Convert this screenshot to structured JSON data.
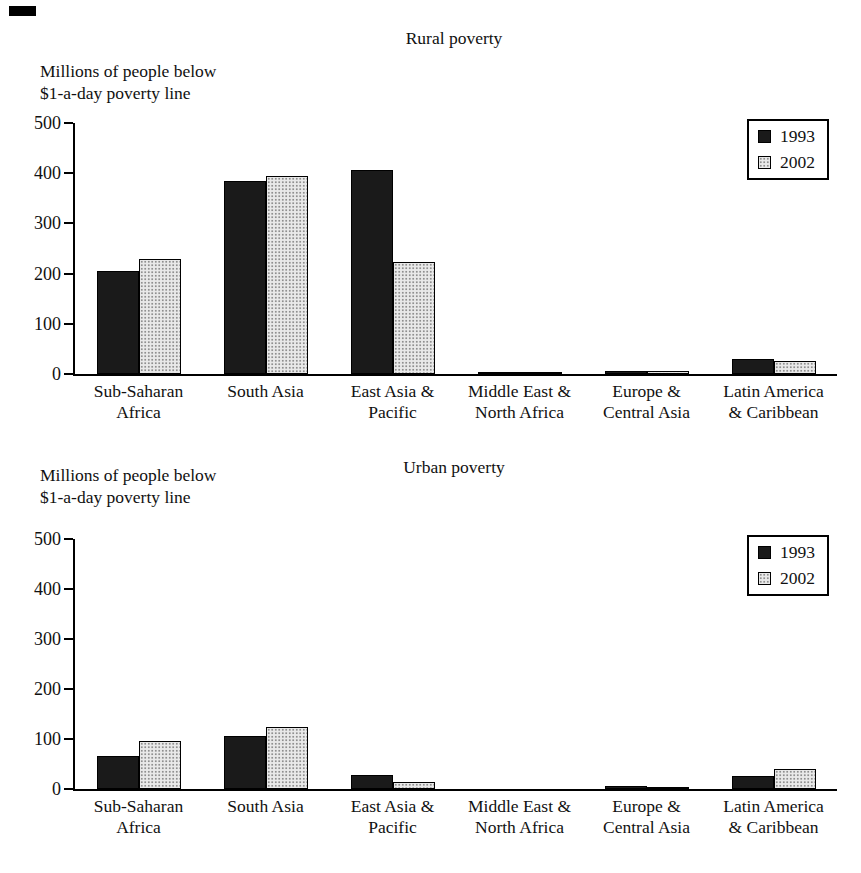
{
  "figure": {
    "kind": "printed book figure, two stacked bar charts",
    "corner_mark": "black dash (scan artifact) at top-left"
  },
  "colors": {
    "background": "#ffffff",
    "text": "#111111",
    "axis": "#000000",
    "bar_1993": "#1a1a1a",
    "bar_2002": "#e9e9e9",
    "bar_2002_dots": "#8f8f8f"
  },
  "chart_data": [
    {
      "type": "bar",
      "title": "Rural poverty",
      "ylabel": "Millions of people below $1-a-day poverty line",
      "ylabel_lines": [
        "Millions of people below",
        "$1-a-day poverty line"
      ],
      "xlabel": "",
      "categories": [
        "Sub-Saharan Africa",
        "South Asia",
        "East Asia & Pacific",
        "Middle East & North Africa",
        "Europe & Central Asia",
        "Latin America & Caribbean"
      ],
      "category_lines": [
        [
          "Sub-Saharan",
          "Africa"
        ],
        [
          "South Asia"
        ],
        [
          "East Asia &",
          "Pacific"
        ],
        [
          "Middle East &",
          "North Africa"
        ],
        [
          "Europe &",
          "Central Asia"
        ],
        [
          "Latin America",
          "& Caribbean"
        ]
      ],
      "series": [
        {
          "name": "1993",
          "color": "#1a1a1a",
          "pattern": "solid-black",
          "values": [
            206,
            385,
            407,
            5,
            6,
            30
          ]
        },
        {
          "name": "2002",
          "color": "#e9e9e9",
          "pattern": "light-dotted",
          "values": [
            229,
            395,
            223,
            5,
            6,
            25
          ]
        }
      ],
      "ylim": [
        0,
        500
      ],
      "yticks": [
        0,
        100,
        200,
        300,
        400,
        500
      ],
      "grid": false,
      "legend_position": "top-right"
    },
    {
      "type": "bar",
      "title": "Urban poverty",
      "ylabel": "Millions of people below $1-a-day poverty line",
      "ylabel_lines": [
        "Millions of people below",
        "$1-a-day poverty line"
      ],
      "xlabel": "",
      "categories": [
        "Sub-Saharan Africa",
        "South Asia",
        "East Asia & Pacific",
        "Middle East & North Africa",
        "Europe & Central Asia",
        "Latin America & Caribbean"
      ],
      "category_lines": [
        [
          "Sub-Saharan",
          "Africa"
        ],
        [
          "South Asia"
        ],
        [
          "East Asia &",
          "Pacific"
        ],
        [
          "Middle East &",
          "North Africa"
        ],
        [
          "Europe &",
          "Central Asia"
        ],
        [
          "Latin America",
          "& Caribbean"
        ]
      ],
      "series": [
        {
          "name": "1993",
          "color": "#1a1a1a",
          "pattern": "solid-black",
          "values": [
            66,
            107,
            28,
            1,
            6,
            26
          ]
        },
        {
          "name": "2002",
          "color": "#e9e9e9",
          "pattern": "light-dotted",
          "values": [
            97,
            125,
            15,
            1,
            3,
            40
          ]
        }
      ],
      "ylim": [
        0,
        500
      ],
      "yticks": [
        0,
        100,
        200,
        300,
        400,
        500
      ],
      "grid": false,
      "legend_position": "top-right"
    }
  ]
}
